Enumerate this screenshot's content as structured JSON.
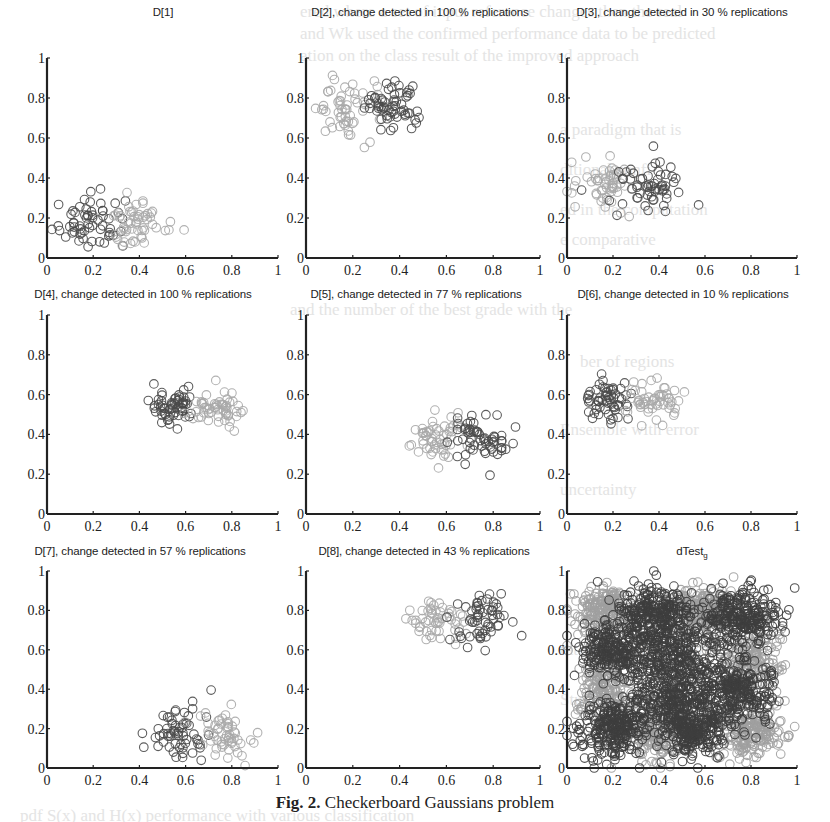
{
  "caption": {
    "label": "Fig. 2.",
    "text": "Checkerboard Gaussians problem"
  },
  "colors": {
    "axis": "#222222",
    "marker_dark": "#4a4a4a",
    "marker_mid": "#7a7a7a",
    "marker_light": "#a9a9a9",
    "dense_dark": "#3e3e3e",
    "dense_light": "#a0a0a0"
  },
  "chart_data": [
    {
      "id": "D1",
      "type": "scatter",
      "title": "D[1]",
      "xlim": [
        0,
        1
      ],
      "ylim": [
        0,
        1
      ],
      "xticks": [
        "0",
        "0.2",
        "0.4",
        "0.6",
        "0.8",
        "1"
      ],
      "yticks": [
        "0",
        "0.2",
        "0.4",
        "0.6",
        "0.8",
        "1"
      ],
      "clusters": [
        {
          "shade": "dark",
          "cx": 0.18,
          "cy": 0.18,
          "sx": 0.07,
          "sy": 0.07,
          "n": 60,
          "seed": 11
        },
        {
          "shade": "light",
          "cx": 0.38,
          "cy": 0.17,
          "sx": 0.07,
          "sy": 0.06,
          "n": 55,
          "seed": 12
        }
      ]
    },
    {
      "id": "D2",
      "type": "scatter",
      "title": "D[2], change detected in 100 % replications",
      "xlim": [
        0,
        1
      ],
      "ylim": [
        0,
        1
      ],
      "xticks": [
        "0",
        "0.2",
        "0.4",
        "0.6",
        "0.8",
        "1"
      ],
      "yticks": [
        "0",
        "0.2",
        "0.4",
        "0.6",
        "0.8",
        "1"
      ],
      "clusters": [
        {
          "shade": "light",
          "cx": 0.17,
          "cy": 0.75,
          "sx": 0.07,
          "sy": 0.07,
          "n": 55,
          "seed": 21
        },
        {
          "shade": "dark",
          "cx": 0.36,
          "cy": 0.75,
          "sx": 0.06,
          "sy": 0.06,
          "n": 60,
          "seed": 22
        }
      ]
    },
    {
      "id": "D3",
      "type": "scatter",
      "title": "D[3], change detected in 30 % replications",
      "xlim": [
        0,
        1
      ],
      "ylim": [
        0,
        1
      ],
      "xticks": [
        "0",
        "0.2",
        "0.4",
        "0.6",
        "0.8",
        "1"
      ],
      "yticks": [
        "0",
        "0.2",
        "0.4",
        "0.6",
        "0.8",
        "1"
      ],
      "clusters": [
        {
          "shade": "light",
          "cx": 0.17,
          "cy": 0.36,
          "sx": 0.07,
          "sy": 0.06,
          "n": 55,
          "seed": 31
        },
        {
          "shade": "dark",
          "cx": 0.37,
          "cy": 0.36,
          "sx": 0.07,
          "sy": 0.06,
          "n": 60,
          "seed": 32
        }
      ]
    },
    {
      "id": "D4",
      "type": "scatter",
      "title": "D[4], change detected in 100 % replications",
      "xlim": [
        0,
        1
      ],
      "ylim": [
        0,
        1
      ],
      "xticks": [
        "0",
        "0.2",
        "0.4",
        "0.6",
        "0.8",
        "1"
      ],
      "yticks": [
        "0",
        "0.2",
        "0.4",
        "0.6",
        "0.8",
        "1"
      ],
      "clusters": [
        {
          "shade": "dark",
          "cx": 0.55,
          "cy": 0.55,
          "sx": 0.05,
          "sy": 0.05,
          "n": 60,
          "seed": 41
        },
        {
          "shade": "light",
          "cx": 0.74,
          "cy": 0.54,
          "sx": 0.06,
          "sy": 0.05,
          "n": 55,
          "seed": 42
        }
      ]
    },
    {
      "id": "D5",
      "type": "scatter",
      "title": "D[5], change detected in 77 % replications",
      "xlim": [
        0,
        1
      ],
      "ylim": [
        0,
        1
      ],
      "xticks": [
        "0",
        "0.2",
        "0.4",
        "0.6",
        "0.8",
        "1"
      ],
      "yticks": [
        "0",
        "0.2",
        "0.4",
        "0.6",
        "0.8",
        "1"
      ],
      "clusters": [
        {
          "shade": "light",
          "cx": 0.56,
          "cy": 0.37,
          "sx": 0.06,
          "sy": 0.06,
          "n": 55,
          "seed": 51
        },
        {
          "shade": "dark",
          "cx": 0.74,
          "cy": 0.37,
          "sx": 0.06,
          "sy": 0.06,
          "n": 60,
          "seed": 52
        }
      ]
    },
    {
      "id": "D6",
      "type": "scatter",
      "title": "D[6], change detected in 10 % replications",
      "xlim": [
        0,
        1
      ],
      "ylim": [
        0,
        1
      ],
      "xticks": [
        "0",
        "0.2",
        "0.4",
        "0.6",
        "0.8",
        "1"
      ],
      "yticks": [
        "0",
        "0.2",
        "0.4",
        "0.6",
        "0.8",
        "1"
      ],
      "clusters": [
        {
          "shade": "dark",
          "cx": 0.18,
          "cy": 0.57,
          "sx": 0.06,
          "sy": 0.05,
          "n": 60,
          "seed": 61
        },
        {
          "shade": "light",
          "cx": 0.37,
          "cy": 0.56,
          "sx": 0.06,
          "sy": 0.05,
          "n": 55,
          "seed": 62
        }
      ]
    },
    {
      "id": "D7",
      "type": "scatter",
      "title": "D[7], change detected in 57 % replications",
      "xlim": [
        0,
        1
      ],
      "ylim": [
        0,
        1
      ],
      "xticks": [
        "0",
        "0.2",
        "0.4",
        "0.6",
        "0.8",
        "1"
      ],
      "yticks": [
        "0",
        "0.2",
        "0.4",
        "0.6",
        "0.8",
        "1"
      ],
      "clusters": [
        {
          "shade": "dark",
          "cx": 0.57,
          "cy": 0.17,
          "sx": 0.06,
          "sy": 0.07,
          "n": 60,
          "seed": 71
        },
        {
          "shade": "light",
          "cx": 0.76,
          "cy": 0.17,
          "sx": 0.06,
          "sy": 0.06,
          "n": 55,
          "seed": 72
        }
      ]
    },
    {
      "id": "D8",
      "type": "scatter",
      "title": "D[8], change detected in 43 % replications",
      "xlim": [
        0,
        1
      ],
      "ylim": [
        0,
        1
      ],
      "xticks": [
        "0",
        "0.2",
        "0.4",
        "0.6",
        "0.8",
        "1"
      ],
      "yticks": [
        "0",
        "0.2",
        "0.4",
        "0.6",
        "0.8",
        "1"
      ],
      "clusters": [
        {
          "shade": "light",
          "cx": 0.56,
          "cy": 0.74,
          "sx": 0.06,
          "sy": 0.06,
          "n": 55,
          "seed": 81
        },
        {
          "shade": "dark",
          "cx": 0.75,
          "cy": 0.75,
          "sx": 0.06,
          "sy": 0.07,
          "n": 60,
          "seed": 82
        }
      ]
    },
    {
      "id": "dTest",
      "type": "scatter",
      "title": "dTest",
      "title_sub": "g",
      "xlim": [
        0,
        1
      ],
      "ylim": [
        0,
        1
      ],
      "xticks": [
        "0",
        "0.2",
        "0.4",
        "0.6",
        "0.8",
        "1"
      ],
      "yticks": [
        "0",
        "0.2",
        "0.4",
        "0.6",
        "0.8",
        "1"
      ],
      "clusters": [
        {
          "shade": "dense_light",
          "cx": 0.17,
          "cy": 0.8,
          "sx": 0.07,
          "sy": 0.06,
          "n": 200,
          "seed": 91
        },
        {
          "shade": "dense_light",
          "cx": 0.58,
          "cy": 0.8,
          "sx": 0.07,
          "sy": 0.06,
          "n": 200,
          "seed": 92
        },
        {
          "shade": "dense_light",
          "cx": 0.17,
          "cy": 0.4,
          "sx": 0.06,
          "sy": 0.07,
          "n": 150,
          "seed": 93
        },
        {
          "shade": "dense_light",
          "cx": 0.8,
          "cy": 0.2,
          "sx": 0.07,
          "sy": 0.07,
          "n": 200,
          "seed": 94
        },
        {
          "shade": "dense_light",
          "cx": 0.38,
          "cy": 0.18,
          "sx": 0.07,
          "sy": 0.07,
          "n": 180,
          "seed": 95
        },
        {
          "shade": "dense_light",
          "cx": 0.8,
          "cy": 0.55,
          "sx": 0.07,
          "sy": 0.08,
          "n": 180,
          "seed": 96
        },
        {
          "shade": "dense_dark",
          "cx": 0.38,
          "cy": 0.78,
          "sx": 0.08,
          "sy": 0.07,
          "n": 260,
          "seed": 101
        },
        {
          "shade": "dense_dark",
          "cx": 0.75,
          "cy": 0.77,
          "sx": 0.08,
          "sy": 0.07,
          "n": 260,
          "seed": 102
        },
        {
          "shade": "dense_dark",
          "cx": 0.2,
          "cy": 0.6,
          "sx": 0.08,
          "sy": 0.07,
          "n": 240,
          "seed": 103
        },
        {
          "shade": "dense_dark",
          "cx": 0.45,
          "cy": 0.55,
          "sx": 0.1,
          "sy": 0.1,
          "n": 320,
          "seed": 104
        },
        {
          "shade": "dense_dark",
          "cx": 0.74,
          "cy": 0.4,
          "sx": 0.08,
          "sy": 0.08,
          "n": 260,
          "seed": 105
        },
        {
          "shade": "dense_dark",
          "cx": 0.2,
          "cy": 0.2,
          "sx": 0.08,
          "sy": 0.07,
          "n": 260,
          "seed": 106
        },
        {
          "shade": "dense_dark",
          "cx": 0.55,
          "cy": 0.2,
          "sx": 0.08,
          "sy": 0.07,
          "n": 260,
          "seed": 107
        },
        {
          "shade": "dense_dark",
          "cx": 0.45,
          "cy": 0.35,
          "sx": 0.1,
          "sy": 0.08,
          "n": 220,
          "seed": 108
        }
      ]
    }
  ],
  "layout_panels": [
    {
      "x0": 47,
      "x1": 278,
      "y0": 258,
      "y1": 58,
      "title_x": 163,
      "title_y": 10
    },
    {
      "x0": 306,
      "x1": 540,
      "y0": 258,
      "y1": 58,
      "title_x": 420,
      "title_y": 10
    },
    {
      "x0": 567,
      "x1": 797,
      "y0": 258,
      "y1": 58,
      "title_x": 682,
      "title_y": 10
    },
    {
      "x0": 47,
      "x1": 278,
      "y0": 514,
      "y1": 315,
      "title_x": 143,
      "title_y": 291
    },
    {
      "x0": 306,
      "x1": 540,
      "y0": 514,
      "y1": 315,
      "title_x": 416,
      "title_y": 291
    },
    {
      "x0": 567,
      "x1": 797,
      "y0": 514,
      "y1": 315,
      "title_x": 683,
      "title_y": 291
    },
    {
      "x0": 47,
      "x1": 278,
      "y0": 768,
      "y1": 571,
      "title_x": 140,
      "title_y": 548
    },
    {
      "x0": 306,
      "x1": 540,
      "y0": 768,
      "y1": 571,
      "title_x": 424,
      "title_y": 548
    },
    {
      "x0": 567,
      "x1": 797,
      "y0": 768,
      "y1": 571,
      "title_x": 692,
      "title_y": 548
    }
  ]
}
